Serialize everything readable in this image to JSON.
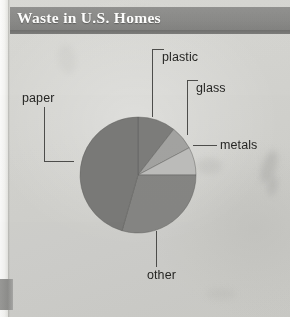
{
  "figure": {
    "title": "Waste in U.S. Homes"
  },
  "chart_data": {
    "type": "pie",
    "title": "Waste in U.S. Homes",
    "xlabel": "",
    "ylabel": "",
    "legend_position": "none",
    "grid": false,
    "start_angle_deg": 0,
    "direction": "clockwise",
    "categories": [
      "plastic",
      "glass",
      "metals",
      "other",
      "paper"
    ],
    "values": [
      10.5,
      6.7,
      7.8,
      29.5,
      45.5
    ],
    "units": "percent",
    "slices": [
      {
        "label": "plastic",
        "value": 10.5,
        "start_deg": 0,
        "end_deg": 38,
        "color": "#7d7d7b"
      },
      {
        "label": "glass",
        "value": 6.7,
        "start_deg": 38,
        "end_deg": 62,
        "color": "#a3a3a1"
      },
      {
        "label": "metals",
        "value": 7.8,
        "start_deg": 62,
        "end_deg": 90,
        "color": "#bdbdbb"
      },
      {
        "label": "other",
        "value": 29.5,
        "start_deg": 90,
        "end_deg": 196,
        "color": "#868684"
      },
      {
        "label": "paper",
        "value": 45.5,
        "start_deg": 196,
        "end_deg": 360,
        "color": "#7a7a78"
      }
    ],
    "annotations": [
      {
        "label": "plastic",
        "leader": "elbow-down-left"
      },
      {
        "label": "glass",
        "leader": "elbow-down-left"
      },
      {
        "label": "metals",
        "leader": "horizontal-dash"
      },
      {
        "label": "paper",
        "leader": "elbow-down-right"
      },
      {
        "label": "other",
        "leader": "vertical-up"
      }
    ]
  },
  "colors": {
    "paper_background": "#d3d3cf",
    "title_band": "#8a8a88",
    "title_text": "#fdfdfc",
    "label_text": "#262624",
    "leader_line": "#4d4d4b",
    "page_tab": "#8e8e8c"
  }
}
